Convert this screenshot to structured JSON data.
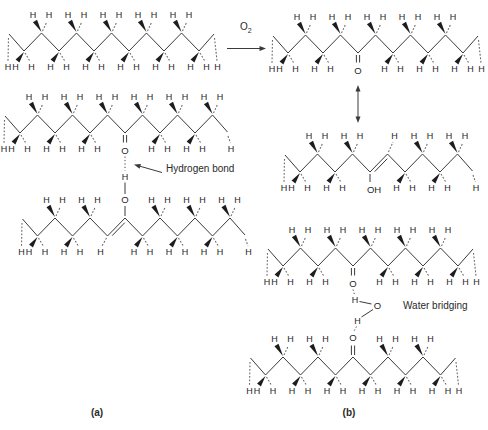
{
  "canvas": {
    "width": 488,
    "height": 430,
    "background": "#ffffff",
    "ink": "#3a3a3a"
  },
  "atoms": {
    "hydrogen": "H",
    "oxygen": "O",
    "hydroxyl": "OH"
  },
  "labels": {
    "oxidant_symbol": "O",
    "oxidant_subscript": "2",
    "hydrogen_bond": "Hydrogen bond",
    "water_bridging": "Water bridging",
    "panel_a": "(a)",
    "panel_b": "(b)"
  },
  "molecules": [
    {
      "id": "alkane-a-top",
      "panel": "a",
      "kind": "alkane",
      "x0": 24,
      "n": 11,
      "y_mid": 42
    },
    {
      "id": "ketone-b-top",
      "panel": "b",
      "kind": "ketone",
      "o_dir": "down",
      "o_index": 4,
      "x0": 288,
      "n": 11,
      "y_mid": 44
    },
    {
      "id": "ketone-a-middle",
      "panel": "a",
      "kind": "ketone",
      "o_dir": "down",
      "o_index": 6,
      "x0": 20,
      "n": 12,
      "y_mid": 124
    },
    {
      "id": "enol-a-bottom",
      "panel": "a",
      "kind": "enol",
      "o_dir": "up",
      "o_index": 5,
      "vinyl_index": 4,
      "x0": 37.5,
      "n": 12,
      "y_mid": 227
    },
    {
      "id": "enol-b-middle",
      "panel": "b",
      "kind": "enol",
      "o_dir": "down",
      "o_index": 4,
      "vinyl_index": 5,
      "x0": 300,
      "n": 10,
      "y_mid": 163
    },
    {
      "id": "ketone-b-lower",
      "panel": "b",
      "kind": "ketone",
      "o_dir": "down",
      "o_index": 4,
      "x0": 283,
      "n": 11,
      "y_mid": 257
    },
    {
      "id": "ketone-b-bottom",
      "panel": "b",
      "kind": "ketone",
      "o_dir": "up",
      "o_index": 5,
      "x0": 265.5,
      "n": 11,
      "y_mid": 366
    }
  ],
  "connections": {
    "oxidation_arrow": {
      "x1": 227,
      "x2": 266,
      "y": 48.5
    },
    "resonance_arrow": {
      "x": 358,
      "y1": 85,
      "y2": 123
    },
    "hydrogen_bond": {
      "x": 125,
      "o_top_y": 150.5,
      "h_y": 176.5,
      "o_bottom_y": 200
    },
    "hb_pointer": {
      "x1": 162,
      "y1": 172.5,
      "x2": 134,
      "y2": 164.5
    },
    "water_bridge": {
      "x_top": 353,
      "o_top_y": 283.5,
      "h1": [
        355,
        300
      ],
      "o_w": [
        377.5,
        305.5
      ],
      "h2": [
        357.5,
        321
      ],
      "o_bottom_y": 337.5,
      "x_bottom": 353
    }
  }
}
